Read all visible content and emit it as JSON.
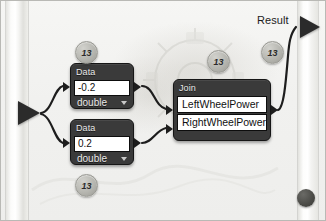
{
  "app": {
    "title": "Visual Dataflow Editor Canvas"
  },
  "canvas": {
    "input_port_name": "input-arrow",
    "result": {
      "label": "Result",
      "arrow_name": "result-output-arrow"
    },
    "corner_dot_name": "corner-dot"
  },
  "nodes": [
    {
      "id": "data-top",
      "header": "Data",
      "value": "-0.2",
      "type_label": "double",
      "caret": "chevron-down-icon"
    },
    {
      "id": "data-bottom",
      "header": "Data",
      "value": "0.2",
      "type_label": "double",
      "caret": "chevron-down-icon"
    },
    {
      "id": "join",
      "header": "Join",
      "rows": [
        "LeftWheelPower",
        "RightWheelPower"
      ]
    }
  ],
  "badges": [
    {
      "id": "badge-top-left",
      "label": "13"
    },
    {
      "id": "badge-middle",
      "label": "13"
    },
    {
      "id": "badge-top-right",
      "label": "13"
    },
    {
      "id": "badge-bottom-left",
      "label": "13"
    }
  ],
  "colors": {
    "node_body": "#3a3a3a",
    "node_border": "#161616",
    "field_background": "#ffffff",
    "field_text": "#111111",
    "header_text": "#e9e9e9",
    "wire": "#1d1d1d",
    "badge_fill": "#b6b6b0",
    "canvas_background": "#f1f1ef",
    "rail": "#ffffff",
    "corner_dot": "#4a4a46"
  }
}
